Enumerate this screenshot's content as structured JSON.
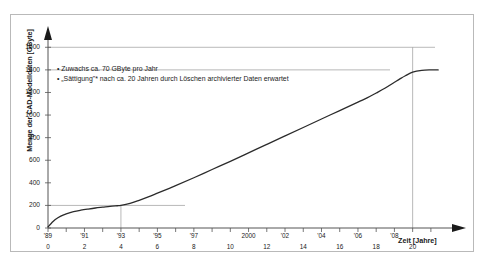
{
  "chart_data": {
    "type": "line",
    "title": "",
    "xlabel": "Zeit [Jahre]",
    "ylabel": "Menge der CAD-Modelldaten [GByte]",
    "ylim": [
      0,
      1700
    ],
    "xlim": [
      0,
      21.5
    ],
    "yticks": [
      0,
      200,
      400,
      600,
      800,
      1000,
      1200,
      1400,
      1600
    ],
    "ytick_labels": [
      "0",
      "200",
      "400",
      "600",
      "800",
      "1000",
      "1200",
      "1400",
      "1600"
    ],
    "xticks_years": [
      {
        "x": 0,
        "label": "'89"
      },
      {
        "x": 2,
        "label": "'91"
      },
      {
        "x": 4,
        "label": "'93"
      },
      {
        "x": 6,
        "label": "'95"
      },
      {
        "x": 8,
        "label": "'97"
      },
      {
        "x": 11,
        "label": "2000"
      },
      {
        "x": 13,
        "label": "'02"
      },
      {
        "x": 15,
        "label": "'04"
      },
      {
        "x": 17,
        "label": "'06"
      },
      {
        "x": 19,
        "label": "'08"
      }
    ],
    "xticks_numbers": [
      {
        "x": 0,
        "label": "0"
      },
      {
        "x": 2,
        "label": "2"
      },
      {
        "x": 4,
        "label": "4"
      },
      {
        "x": 6,
        "label": "6"
      },
      {
        "x": 8,
        "label": "8"
      },
      {
        "x": 10,
        "label": "10"
      },
      {
        "x": 12,
        "label": "12"
      },
      {
        "x": 14,
        "label": "14"
      },
      {
        "x": 16,
        "label": "16"
      },
      {
        "x": 18,
        "label": "18"
      },
      {
        "x": 20,
        "label": "20"
      }
    ],
    "grid": "partial",
    "gridlines_horizontal": [
      200,
      1400,
      1600
    ],
    "gridlines_vertical": [
      4,
      20
    ],
    "legend": [],
    "series": [
      {
        "name": "Menge der CAD-Modelldaten",
        "color": "#2b2b2b",
        "x": [
          0,
          0.2,
          0.4,
          0.7,
          1.0,
          1.4,
          1.8,
          2.2,
          2.6,
          3.0,
          3.4,
          3.8,
          4.0,
          4.5,
          5.0,
          5.5,
          6.0,
          7.0,
          8.0,
          9.0,
          10.0,
          11.0,
          12.0,
          13.0,
          14.0,
          15.0,
          16.0,
          17.0,
          17.5,
          18.0,
          18.5,
          19.0,
          19.3,
          19.6,
          20.0,
          20.5,
          21.0,
          21.4
        ],
        "y": [
          10,
          45,
          75,
          105,
          125,
          145,
          158,
          168,
          177,
          184,
          191,
          197,
          200,
          218,
          245,
          275,
          308,
          375,
          445,
          518,
          590,
          665,
          740,
          815,
          890,
          965,
          1040,
          1115,
          1152,
          1195,
          1240,
          1290,
          1320,
          1348,
          1380,
          1396,
          1400,
          1400
        ]
      }
    ],
    "annotations": [
      "• Zuwachs ca. 70 GByte pro Jahr",
      "• „Sättigung\"* nach ca. 20 Jahren durch Löschen archivierter Daten erwartet"
    ]
  },
  "axis": {
    "y_title": "Menge der CAD-Modelldaten [GByte]",
    "x_title": "Zeit [Jahre]"
  },
  "colors": {
    "curve": "#2b2b2b",
    "axis": "#555555",
    "grid": "#9a9a9a",
    "frame": "#b9b9b9",
    "text": "#1a1a1a"
  }
}
